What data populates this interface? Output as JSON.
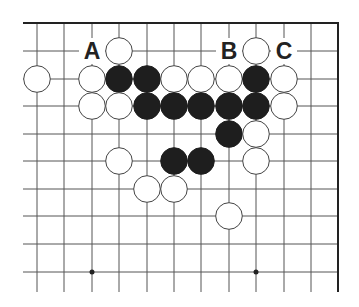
{
  "diagram": {
    "type": "go-board-fragment",
    "grid": {
      "columns_x": [
        37,
        64,
        92,
        119,
        147,
        174,
        201,
        229,
        256,
        284,
        311
      ],
      "rows_y": [
        51,
        79,
        106,
        134,
        161,
        189,
        216,
        244,
        272
      ],
      "top_edge_y": 23,
      "right_edge_x": 338,
      "left_extent_x": 23,
      "bottom_extent_y": 292,
      "line_color": "#555555",
      "edge_color": "#222222"
    },
    "star_points": [
      {
        "col": 2,
        "row": 9
      },
      {
        "col": 8,
        "row": 9
      }
    ],
    "stones": [
      {
        "color": "white",
        "col": 3,
        "row": 1
      },
      {
        "color": "white",
        "col": 8,
        "row": 1
      },
      {
        "color": "white",
        "col": 0,
        "row": 2
      },
      {
        "color": "white",
        "col": 2,
        "row": 2
      },
      {
        "color": "black",
        "col": 3,
        "row": 2
      },
      {
        "color": "black",
        "col": 4,
        "row": 2
      },
      {
        "color": "white",
        "col": 5,
        "row": 2
      },
      {
        "color": "white",
        "col": 6,
        "row": 2
      },
      {
        "color": "white",
        "col": 7,
        "row": 2
      },
      {
        "color": "black",
        "col": 8,
        "row": 2
      },
      {
        "color": "white",
        "col": 9,
        "row": 2
      },
      {
        "color": "white",
        "col": 2,
        "row": 3
      },
      {
        "color": "white",
        "col": 3,
        "row": 3
      },
      {
        "color": "black",
        "col": 4,
        "row": 3
      },
      {
        "color": "black",
        "col": 5,
        "row": 3
      },
      {
        "color": "black",
        "col": 6,
        "row": 3
      },
      {
        "color": "black",
        "col": 7,
        "row": 3
      },
      {
        "color": "black",
        "col": 8,
        "row": 3
      },
      {
        "color": "white",
        "col": 9,
        "row": 3
      },
      {
        "color": "black",
        "col": 7,
        "row": 4
      },
      {
        "color": "white",
        "col": 8,
        "row": 4
      },
      {
        "color": "white",
        "col": 3,
        "row": 5
      },
      {
        "color": "black",
        "col": 5,
        "row": 5
      },
      {
        "color": "black",
        "col": 6,
        "row": 5
      },
      {
        "color": "white",
        "col": 8,
        "row": 5
      },
      {
        "color": "white",
        "col": 4,
        "row": 6
      },
      {
        "color": "white",
        "col": 5,
        "row": 6
      },
      {
        "color": "white",
        "col": 7,
        "row": 7
      }
    ],
    "labels": [
      {
        "text": "A",
        "col": 2,
        "row": 1
      },
      {
        "text": "B",
        "col": 7,
        "row": 1
      },
      {
        "text": "C",
        "col": 9,
        "row": 1
      }
    ],
    "colors": {
      "black_stone": "#1e1e1e",
      "white_stone_fill": "#ffffff",
      "white_stone_stroke": "#444444"
    }
  }
}
